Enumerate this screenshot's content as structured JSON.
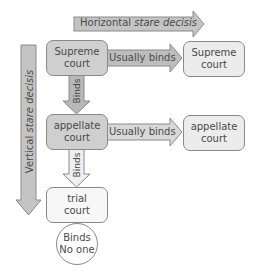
{
  "horizontal_arrow": {
    "label_plain": "Horizontal ",
    "label_italic": "stare decisis"
  },
  "vertical_arrow": {
    "label_plain": "Vertical ",
    "label_italic": "stare decisis"
  },
  "nodes": {
    "supreme_left": {
      "line1": "Supreme",
      "line2": "court"
    },
    "supreme_right": {
      "line1": "Supreme",
      "line2": "court"
    },
    "appellate_left": {
      "line1": "appellate",
      "line2": "court"
    },
    "appellate_right": {
      "line1": "appellate",
      "line2": "court"
    },
    "trial": {
      "line1": "trial",
      "line2": "court"
    },
    "binds_no_one": {
      "line1": "Binds",
      "line2": "No one"
    }
  },
  "edges": {
    "supreme_horizontal": "Usually binds",
    "appellate_horizontal": "Usually binds",
    "supreme_to_appellate": "Binds",
    "appellate_to_trial": "Binds"
  },
  "colors": {
    "arrow_dark": "#b8b8b8",
    "arrow_light": "#e4e4e4",
    "outline": "#8a8a8a"
  }
}
